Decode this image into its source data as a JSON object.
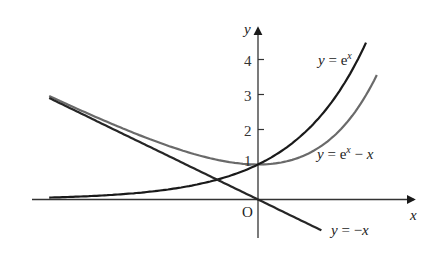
{
  "chart_data": {
    "type": "line",
    "title": "",
    "xlabel": "x",
    "ylabel": "y",
    "origin_label": "O",
    "xlim": [
      -2.9,
      2.2
    ],
    "ylim": [
      -1.0,
      5.0
    ],
    "grid": false,
    "y_ticks": [
      1,
      2,
      3,
      4
    ],
    "x_ticks": [],
    "series": [
      {
        "name": "y = e^x",
        "function": "exp(x)",
        "x_range": [
          -2.9,
          1.5
        ],
        "color": "#1a1a1a",
        "label_parts": [
          "y",
          " = e",
          "x"
        ]
      },
      {
        "name": "y = e^x - x",
        "function": "exp(x) - x",
        "x_range": [
          -2.9,
          1.65
        ],
        "color": "#6a6a6a",
        "label_parts": [
          "y",
          " = e",
          "x",
          " − ",
          "x"
        ]
      },
      {
        "name": "y = -x",
        "function": "-x",
        "x_range": [
          -2.9,
          0.88
        ],
        "color": "#262626",
        "label_parts": [
          "y",
          " = −",
          "x"
        ]
      }
    ],
    "annotations": [
      {
        "text": "y = e^x",
        "near": [
          1.5,
          4.4
        ]
      },
      {
        "text": "y = e^x − x",
        "near": [
          1.6,
          1.4
        ]
      },
      {
        "text": "y = −x",
        "near": [
          1.0,
          -0.9
        ]
      }
    ]
  },
  "axes": {
    "x_label": "x",
    "y_label": "y",
    "origin": "O",
    "ticks": [
      "1",
      "2",
      "3",
      "4"
    ]
  },
  "labels": {
    "exp": {
      "y": "y",
      "eq": " = e",
      "sup": "x"
    },
    "exp_minus_x": {
      "y": "y",
      "eq": " = e",
      "sup": "x",
      "minus": " − ",
      "x": "x"
    },
    "neg_x": {
      "y": "y",
      "eq": " = −",
      "x": "x"
    }
  }
}
